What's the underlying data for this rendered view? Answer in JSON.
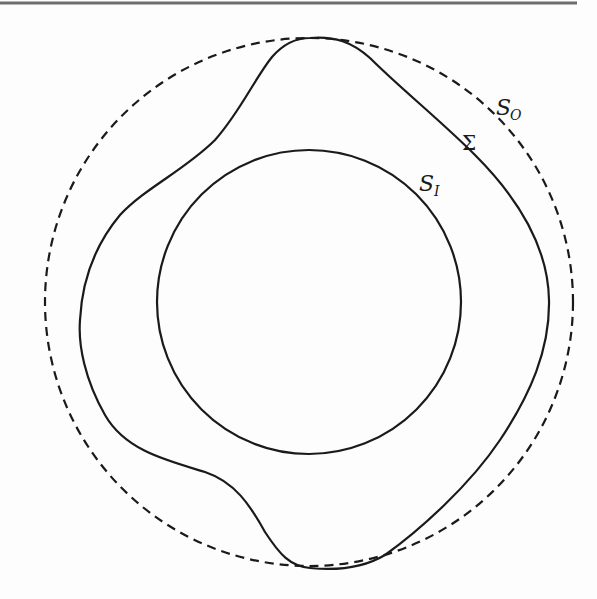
{
  "figure": {
    "top_rule": {
      "y": 3,
      "x1": 0,
      "x2": 577,
      "color": "#6e6e6e"
    },
    "outer_surface": {
      "label_main": "S",
      "label_sub": "O",
      "style": "dashed",
      "shape": "circle",
      "center": [
        309,
        302
      ],
      "radius": 264,
      "color": "#1a1a1a"
    },
    "interface": {
      "label": "Σ",
      "style": "solid",
      "shape": "closed wavy curve",
      "color": "#1a1a1a"
    },
    "inner_surface": {
      "label_main": "S",
      "label_sub": "I",
      "style": "solid",
      "shape": "circle",
      "center": [
        309,
        302
      ],
      "radius": 152,
      "color": "#1a1a1a"
    }
  }
}
